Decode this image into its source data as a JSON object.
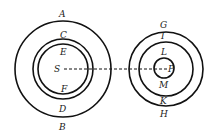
{
  "diagram": {
    "left_system": {
      "center_label": "S",
      "outer_labels": {
        "top": "A",
        "bottom": "B"
      },
      "middle_labels": {
        "top": "C",
        "bottom": "D"
      },
      "inner_labels": {
        "top": "E",
        "bottom": "F"
      }
    },
    "right_system": {
      "center_label": "P",
      "outer_labels": {
        "top": "G",
        "bottom": "H"
      },
      "middle_labels": {
        "top": "I",
        "bottom": "K"
      },
      "inner_labels": {
        "top": "L",
        "bottom": "M"
      }
    },
    "connector": "dashed line from S to P",
    "colors": {
      "stroke": "#111111",
      "background": "#ffffff"
    }
  }
}
